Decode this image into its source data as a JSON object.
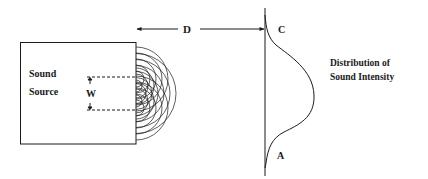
{
  "diagram": {
    "source_label_line1": "Sound",
    "source_label_line2": "Source",
    "width_label": "W",
    "distance_label": "D",
    "top_point_label": "C",
    "bottom_point_label": "A",
    "distribution_label_line1": "Distribution of",
    "distribution_label_line2": "Sound Intensity"
  },
  "colors": {
    "stroke": "#1a1a1a",
    "background": "#ffffff"
  }
}
